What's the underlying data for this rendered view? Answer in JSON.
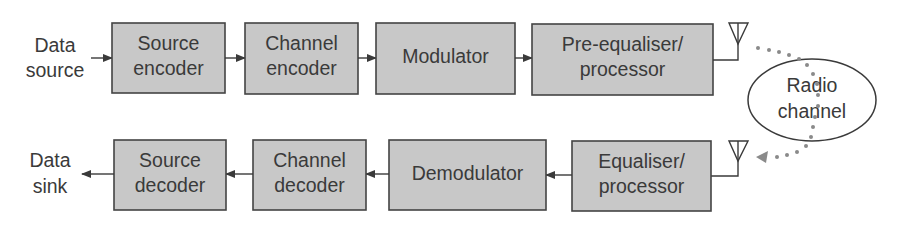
{
  "diagram": {
    "type": "block-diagram",
    "colors": {
      "block_fill": "#c8c8c8",
      "block_stroke": "#444444",
      "text": "#3a3a3a",
      "line": "#3a3a3a",
      "dotted_path": "#8a8a8a",
      "background": "#ffffff"
    },
    "transmitter": {
      "input_label": {
        "line1": "Data",
        "line2": "source"
      },
      "blocks": [
        {
          "id": "source-encoder",
          "line1": "Source",
          "line2": "encoder"
        },
        {
          "id": "channel-encoder",
          "line1": "Channel",
          "line2": "encoder"
        },
        {
          "id": "modulator",
          "line1": "Modulator",
          "line2": ""
        },
        {
          "id": "pre-equaliser-processor",
          "line1": "Pre-equaliser/",
          "line2": "processor"
        }
      ],
      "antenna": "transmit-antenna"
    },
    "channel": {
      "line1": "Radio",
      "line2": "channel"
    },
    "receiver": {
      "output_label": {
        "line1": "Data",
        "line2": "sink"
      },
      "blocks": [
        {
          "id": "source-decoder",
          "line1": "Source",
          "line2": "decoder"
        },
        {
          "id": "channel-decoder",
          "line1": "Channel",
          "line2": "decoder"
        },
        {
          "id": "demodulator",
          "line1": "Demodulator",
          "line2": ""
        },
        {
          "id": "equaliser-processor",
          "line1": "Equaliser/",
          "line2": "processor"
        }
      ],
      "antenna": "receive-antenna"
    },
    "connections": [
      {
        "from": "Data source",
        "to": "Source encoder"
      },
      {
        "from": "Source encoder",
        "to": "Channel encoder"
      },
      {
        "from": "Channel encoder",
        "to": "Modulator"
      },
      {
        "from": "Modulator",
        "to": "Pre-equaliser/processor"
      },
      {
        "from": "Pre-equaliser/processor",
        "to": "transmit-antenna"
      },
      {
        "from": "transmit-antenna",
        "to": "Radio channel",
        "style": "dotted"
      },
      {
        "from": "Radio channel",
        "to": "receive-antenna",
        "style": "dotted"
      },
      {
        "from": "receive-antenna",
        "to": "Equaliser/processor"
      },
      {
        "from": "Equaliser/processor",
        "to": "Demodulator"
      },
      {
        "from": "Demodulator",
        "to": "Channel decoder"
      },
      {
        "from": "Channel decoder",
        "to": "Source decoder"
      },
      {
        "from": "Source decoder",
        "to": "Data sink"
      }
    ]
  }
}
